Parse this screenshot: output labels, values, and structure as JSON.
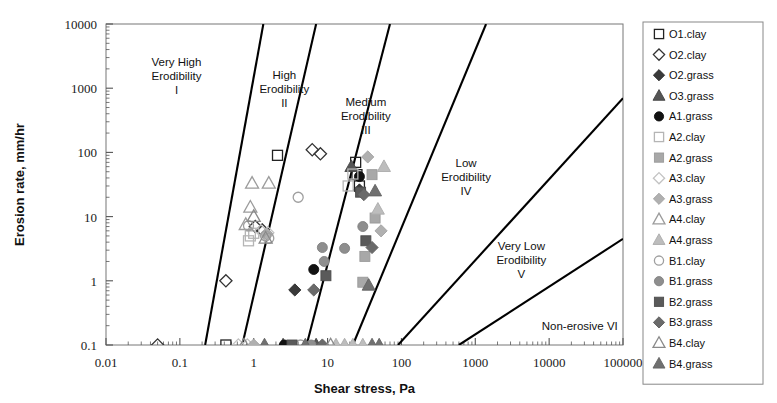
{
  "chart_data": {
    "type": "scatter",
    "title": "",
    "xlabel": "Shear stress, Pa",
    "ylabel": "Erosion rate, mm/hr",
    "xscale": "log",
    "yscale": "log",
    "xlim": [
      0.01,
      100000
    ],
    "ylim": [
      0.1,
      10000
    ],
    "xticks": [
      "0.01",
      "0.1",
      "1",
      "10",
      "100",
      "1000",
      "10000",
      "100000"
    ],
    "yticks": [
      "0.1",
      "1",
      "10",
      "100",
      "1000",
      "10000"
    ],
    "grid": false,
    "legend_position": "right-outside",
    "zones": [
      {
        "id": "I",
        "label_lines": [
          "Very High",
          "Erodibility",
          "I"
        ],
        "x": 0.09,
        "y": 2200
      },
      {
        "id": "II",
        "label_lines": [
          "High",
          "Erodibility",
          "II"
        ],
        "x": 2.6,
        "y": 1400
      },
      {
        "id": "III",
        "label_lines": [
          "Medium",
          "Erodibility",
          "III"
        ],
        "x": 33,
        "y": 520
      },
      {
        "id": "IV",
        "label_lines": [
          "Low",
          "Erodibility",
          "IV"
        ],
        "x": 750,
        "y": 60
      },
      {
        "id": "V",
        "label_lines": [
          "Very Low",
          "Erodibility",
          "V"
        ],
        "x": 4200,
        "y": 3.0
      },
      {
        "id": "VI",
        "label_lines": [
          "Non-erosive VI"
        ],
        "x": 26000,
        "y": 0.17
      }
    ],
    "boundary_lines": [
      {
        "name": "I-II",
        "x1": 0.22,
        "y1": 0.1,
        "x2": 1.35,
        "y2": 10000
      },
      {
        "name": "II-III",
        "x1": 0.7,
        "y1": 0.1,
        "x2": 7.0,
        "y2": 10000
      },
      {
        "name": "III-IV",
        "x1": 5.2,
        "y1": 0.1,
        "x2": 70,
        "y2": 10000
      },
      {
        "name": "IV-V",
        "x1": 22,
        "y1": 0.1,
        "x2": 1400,
        "y2": 10000
      },
      {
        "name": "V-VI",
        "x1": 90,
        "y1": 0.1,
        "x2": 100000,
        "y2": 700
      },
      {
        "name": "VI-low",
        "x1": 600,
        "y1": 0.1,
        "x2": 100000,
        "y2": 4.5
      }
    ],
    "series": [
      {
        "name": "O1.clay",
        "marker": "square",
        "fill": "none",
        "stroke": "#222222",
        "points": [
          [
            2.1,
            90
          ],
          [
            24,
            70
          ],
          [
            25,
            45
          ],
          [
            27,
            30
          ],
          [
            0.42,
            0.1
          ]
        ]
      },
      {
        "name": "O2.clay",
        "marker": "diamond",
        "fill": "none",
        "stroke": "#333333",
        "points": [
          [
            6.2,
            110
          ],
          [
            8.0,
            95
          ],
          [
            1.05,
            7.0
          ],
          [
            1.3,
            6.2
          ],
          [
            0.42,
            1.0
          ],
          [
            0.05,
            0.1
          ]
        ]
      },
      {
        "name": "O2.grass",
        "marker": "diamond",
        "fill": "#3a3a3a",
        "stroke": "#2a2a2a",
        "points": [
          [
            27,
            26
          ],
          [
            3.6,
            0.72
          ]
        ]
      },
      {
        "name": "O3.grass",
        "marker": "triangle",
        "fill": "#555555",
        "stroke": "#444444",
        "points": [
          [
            21,
            60
          ],
          [
            2.5,
            0.1
          ],
          [
            7.0,
            0.1
          ]
        ]
      },
      {
        "name": "A1.grass",
        "marker": "circle",
        "fill": "#121212",
        "stroke": "#0d0d0d",
        "points": [
          [
            27,
            42
          ],
          [
            6.5,
            1.5
          ],
          [
            2.6,
            0.1
          ]
        ]
      },
      {
        "name": "A2.clay",
        "marker": "square",
        "fill": "none",
        "stroke": "#b5b5b5",
        "points": [
          [
            22,
            46
          ],
          [
            19,
            30
          ],
          [
            1.0,
            5.5
          ],
          [
            0.9,
            5.0
          ],
          [
            0.85,
            4.2
          ]
        ]
      },
      {
        "name": "A2.grass",
        "marker": "square",
        "fill": "#a8a8a8",
        "stroke": "#9a9a9a",
        "points": [
          [
            40,
            45
          ],
          [
            44,
            9.5
          ],
          [
            32,
            2.4
          ],
          [
            30,
            0.95
          ]
        ]
      },
      {
        "name": "A3.clay",
        "marker": "diamond",
        "fill": "none",
        "stroke": "#c3c3c3",
        "points": [
          [
            1.25,
            6.0
          ],
          [
            1.5,
            5.2
          ],
          [
            1.55,
            5.6
          ],
          [
            0.62,
            0.1
          ],
          [
            0.82,
            0.1
          ]
        ]
      },
      {
        "name": "A3.grass",
        "marker": "diamond",
        "fill": "#b0b0b0",
        "stroke": "#a2a2a2",
        "points": [
          [
            35,
            85
          ],
          [
            53,
            6.0
          ],
          [
            1.5,
            5.4
          ],
          [
            1.0,
            0.1
          ]
        ]
      },
      {
        "name": "A4.clay",
        "marker": "triangle",
        "fill": "none",
        "stroke": "#9c9c9c",
        "points": [
          [
            0.95,
            33
          ],
          [
            1.6,
            33
          ],
          [
            0.9,
            14
          ],
          [
            0.78,
            7.5
          ]
        ]
      },
      {
        "name": "A4.grass",
        "marker": "triangle",
        "fill": "#bdbdbd",
        "stroke": "#ababab",
        "points": [
          [
            58,
            60
          ],
          [
            48,
            13
          ],
          [
            13,
            0.1
          ],
          [
            17,
            0.1
          ],
          [
            22,
            0.1
          ],
          [
            30,
            0.1
          ]
        ]
      },
      {
        "name": "B1.clay",
        "marker": "circle",
        "fill": "none",
        "stroke": "#9f9f9f",
        "points": [
          [
            4.0,
            20
          ],
          [
            1.45,
            5.0
          ],
          [
            1.6,
            4.6
          ],
          [
            0.85,
            7.2
          ],
          [
            4.3,
            0.1
          ]
        ]
      },
      {
        "name": "B1.grass",
        "marker": "circle",
        "fill": "#8e8e8e",
        "stroke": "#808080",
        "points": [
          [
            30,
            7.0
          ],
          [
            8.5,
            3.3
          ],
          [
            17,
            3.2
          ],
          [
            9.0,
            2.0
          ],
          [
            6.0,
            0.1
          ]
        ]
      },
      {
        "name": "B2.grass",
        "marker": "square",
        "fill": "#5a5a5a",
        "stroke": "#4d4d4d",
        "points": [
          [
            28,
            24
          ],
          [
            33,
            4.2
          ],
          [
            9.5,
            1.2
          ],
          [
            3.3,
            0.1
          ]
        ]
      },
      {
        "name": "B3.grass",
        "marker": "diamond",
        "fill": "#6a6a6a",
        "stroke": "#5c5c5c",
        "points": [
          [
            31,
            22
          ],
          [
            40,
            3.3
          ],
          [
            6.5,
            0.72
          ],
          [
            8.5,
            0.1
          ]
        ]
      },
      {
        "name": "B4.clay",
        "marker": "triangle",
        "fill": "none",
        "stroke": "#8a8a8a",
        "points": [
          [
            1.0,
            10
          ],
          [
            1.45,
            4.6
          ],
          [
            0.74,
            0.1
          ],
          [
            11,
            0.1
          ]
        ]
      },
      {
        "name": "B4.grass",
        "marker": "triangle",
        "fill": "#707070",
        "stroke": "#636363",
        "points": [
          [
            44,
            25
          ],
          [
            36,
            0.85
          ],
          [
            1.4,
            0.1
          ],
          [
            5.0,
            0.1
          ],
          [
            40,
            0.1
          ],
          [
            50,
            0.1
          ]
        ]
      }
    ]
  },
  "legend": {
    "items": [
      {
        "label": "O1.clay",
        "marker": "square",
        "fill": "none",
        "stroke": "#222222"
      },
      {
        "label": "O2.clay",
        "marker": "diamond",
        "fill": "none",
        "stroke": "#333333"
      },
      {
        "label": "O2.grass",
        "marker": "diamond",
        "fill": "#3a3a3a",
        "stroke": "#2a2a2a"
      },
      {
        "label": "O3.grass",
        "marker": "triangle",
        "fill": "#555555",
        "stroke": "#444444"
      },
      {
        "label": "A1.grass",
        "marker": "circle",
        "fill": "#121212",
        "stroke": "#0d0d0d"
      },
      {
        "label": "A2.clay",
        "marker": "square",
        "fill": "none",
        "stroke": "#b5b5b5"
      },
      {
        "label": "A2.grass",
        "marker": "square",
        "fill": "#a8a8a8",
        "stroke": "#9a9a9a"
      },
      {
        "label": "A3.clay",
        "marker": "diamond",
        "fill": "none",
        "stroke": "#c3c3c3"
      },
      {
        "label": "A3.grass",
        "marker": "diamond",
        "fill": "#b0b0b0",
        "stroke": "#a2a2a2"
      },
      {
        "label": "A4.clay",
        "marker": "triangle",
        "fill": "none",
        "stroke": "#9c9c9c"
      },
      {
        "label": "A4.grass",
        "marker": "triangle",
        "fill": "#bdbdbd",
        "stroke": "#ababab"
      },
      {
        "label": "B1.clay",
        "marker": "circle",
        "fill": "none",
        "stroke": "#9f9f9f"
      },
      {
        "label": "B1.grass",
        "marker": "circle",
        "fill": "#8e8e8e",
        "stroke": "#808080"
      },
      {
        "label": "B2.grass",
        "marker": "square",
        "fill": "#5a5a5a",
        "stroke": "#4d4d4d"
      },
      {
        "label": "B3.grass",
        "marker": "diamond",
        "fill": "#6a6a6a",
        "stroke": "#5c5c5c"
      },
      {
        "label": "B4.clay",
        "marker": "triangle",
        "fill": "none",
        "stroke": "#8a8a8a"
      },
      {
        "label": "B4.grass",
        "marker": "triangle",
        "fill": "#707070",
        "stroke": "#636363"
      }
    ]
  },
  "colors": {
    "axis": "#555555",
    "frame": "#777777",
    "boundary": "#000000",
    "text": "#111111",
    "background": "#ffffff"
  }
}
